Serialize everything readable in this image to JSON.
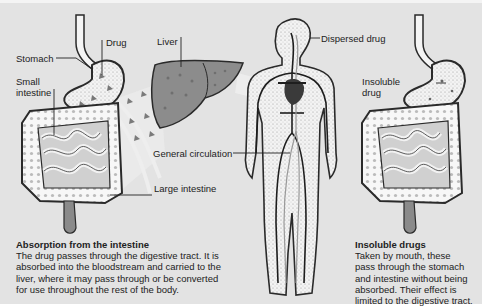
{
  "labels": {
    "stomach": "Stomach",
    "drug": "Drug",
    "small_intestine_line1": "Small",
    "small_intestine_line2": "intestine",
    "liver": "Liver",
    "dispersed_drug": "Dispersed drug",
    "general_circulation": "General circulation",
    "large_intestine": "Large intestine",
    "insoluble_drug_line1": "Insoluble",
    "insoluble_drug_line2": "drug"
  },
  "captions": {
    "absorption": {
      "title": "Absorption from the intestine",
      "lines": [
        "The drug passes through the digestive tract. It is",
        "absorbed into the bloodstream and carried to the",
        "liver, where it may pass through or be converted",
        "for use throughout the rest of the body."
      ]
    },
    "insoluble": {
      "title": "Insoluble drugs",
      "lines": [
        "Taken by mouth, these",
        "pass through the stomach",
        "and intestine without being",
        "absorbed. Their effect is",
        "limited to the digestive tract."
      ]
    }
  },
  "colors": {
    "background": "#e3e3e3",
    "outline": "#2a2a2a",
    "organ_fill": "#f5f5f5",
    "liver_fill": "#8c8c8c",
    "vessel": "#1e1e1e",
    "flow_band": "#f2f2f2"
  }
}
